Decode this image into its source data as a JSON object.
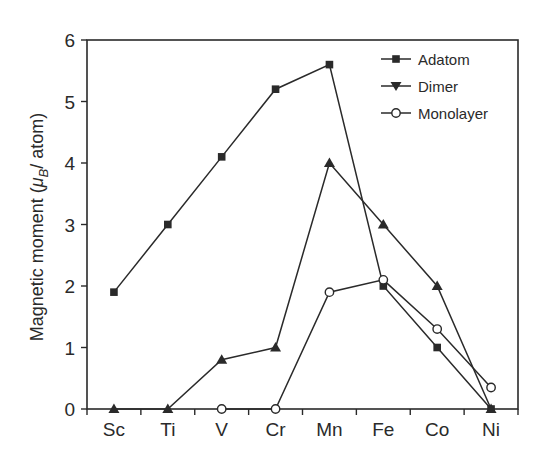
{
  "chart_data": {
    "type": "line",
    "title": "",
    "xlabel": "",
    "ylabel": "Magnetic moment (μB/ atom)",
    "ylabel_parts": {
      "prefix": "Magnetic moment (",
      "mu": "μ",
      "sub": "B",
      "suffix": "/ atom)"
    },
    "categories": [
      "Sc",
      "Ti",
      "V",
      "Cr",
      "Mn",
      "Fe",
      "Co",
      "Ni"
    ],
    "ylim": [
      0,
      6
    ],
    "yticks": [
      0,
      1,
      2,
      3,
      4,
      5,
      6
    ],
    "grid": false,
    "legend_position": "upper right",
    "series": [
      {
        "name": "Adatom",
        "marker": "filled-square",
        "values": [
          1.9,
          3.0,
          4.1,
          5.2,
          5.6,
          2.0,
          1.0,
          0.0
        ]
      },
      {
        "name": "Dimer",
        "marker": "filled-triangle",
        "values": [
          0.0,
          0.0,
          0.8,
          1.0,
          4.0,
          3.0,
          2.0,
          0.0
        ]
      },
      {
        "name": "Monolayer",
        "marker": "open-circle",
        "values": [
          null,
          null,
          0.0,
          0.0,
          1.9,
          2.1,
          1.3,
          0.35
        ]
      }
    ],
    "line_color": "#2a2a2a"
  },
  "legend": {
    "items": [
      {
        "label": "Adatom",
        "marker": "filled-square"
      },
      {
        "label": "Dimer",
        "marker": "filled-triangle-down"
      },
      {
        "label": "Monolayer",
        "marker": "open-circle"
      }
    ]
  }
}
